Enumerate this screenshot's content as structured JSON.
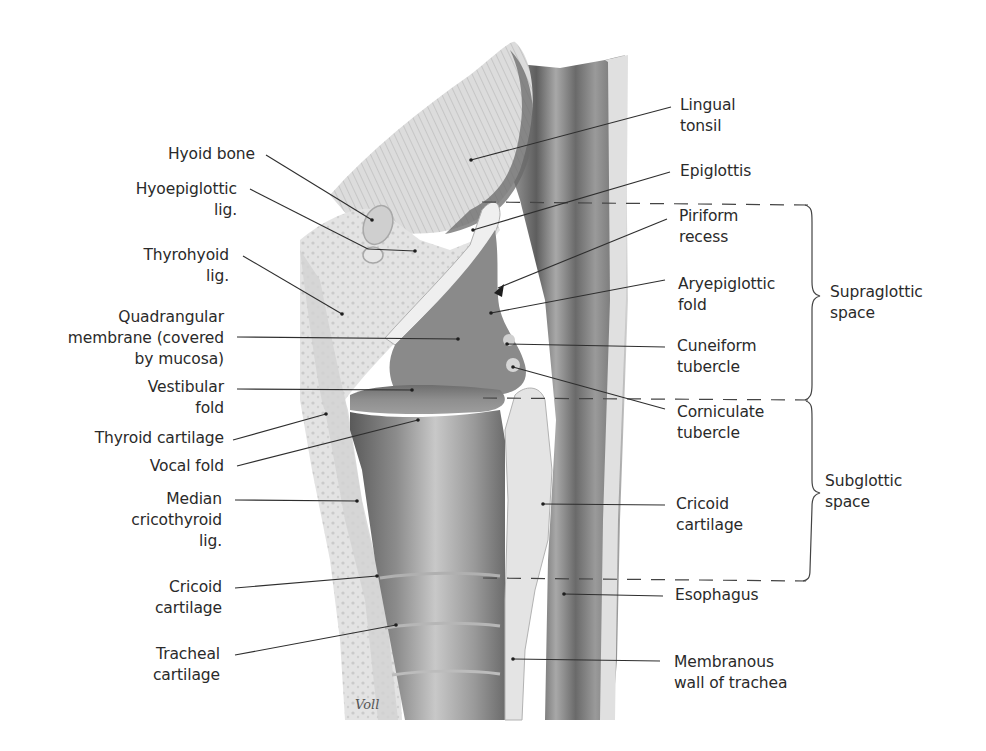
{
  "figure": {
    "signature": "Voll",
    "colors": {
      "background": "#ffffff",
      "label_text": "#2a2a2a",
      "leader_line": "#333333",
      "tissue_light": "#e6e6e6",
      "tissue_mid": "#b9b9b9",
      "tissue_dark": "#5a5a5a"
    }
  },
  "labels_left": [
    {
      "id": "hyoid-bone",
      "text": "Hyoid bone"
    },
    {
      "id": "hyoepiglottic-lig",
      "text": "Hyoepiglottic\nlig."
    },
    {
      "id": "thyrohyoid-lig",
      "text": "Thyrohyoid\nlig."
    },
    {
      "id": "quadrangular-membrane",
      "text": "Quadrangular\nmembrane (covered\nby mucosa)"
    },
    {
      "id": "vestibular-fold",
      "text": "Vestibular\nfold"
    },
    {
      "id": "thyroid-cartilage",
      "text": "Thyroid cartilage"
    },
    {
      "id": "vocal-fold",
      "text": "Vocal fold"
    },
    {
      "id": "median-cricothyroid-lig",
      "text": "Median\ncricothyroid\nlig."
    },
    {
      "id": "cricoid-cartilage-left",
      "text": "Cricoid\ncartilage"
    },
    {
      "id": "tracheal-cartilage",
      "text": "Tracheal\ncartilage"
    }
  ],
  "labels_right": [
    {
      "id": "lingual-tonsil",
      "text": "Lingual\ntonsil"
    },
    {
      "id": "epiglottis",
      "text": "Epiglottis"
    },
    {
      "id": "piriform-recess",
      "text": "Piriform\nrecess"
    },
    {
      "id": "aryepiglottic-fold",
      "text": "Aryepiglottic\nfold"
    },
    {
      "id": "cuneiform-tubercle",
      "text": "Cuneiform\ntubercle"
    },
    {
      "id": "corniculate-tubercle",
      "text": "Corniculate\ntubercle"
    },
    {
      "id": "cricoid-cartilage-right",
      "text": "Cricoid\ncartilage"
    },
    {
      "id": "esophagus",
      "text": "Esophagus"
    },
    {
      "id": "membranous-wall-of-trachea",
      "text": "Membranous\nwall of trachea"
    }
  ],
  "regions": [
    {
      "id": "supraglottic-space",
      "text": "Supraglottic\nspace"
    },
    {
      "id": "subglottic-space",
      "text": "Subglottic\nspace"
    }
  ]
}
